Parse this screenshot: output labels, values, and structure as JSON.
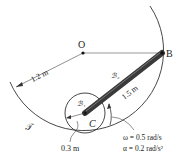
{
  "diagram": {
    "points": {
      "O": "O",
      "B": "B",
      "C": "C"
    },
    "bodies": {
      "fixed": "𝒯",
      "disk": "ℬ₁",
      "rod": "ℬ₂"
    },
    "dimensions": {
      "big_radius": "1.2 m",
      "rod_length": "1.5 m",
      "disk_radius": "0.3 m"
    },
    "kinematics": {
      "omega": "ω = 0.5 rad/s",
      "alpha": "α = 0.2 rad/s²"
    },
    "colors": {
      "rod": "#3a3a3a",
      "line": "#333333"
    }
  }
}
